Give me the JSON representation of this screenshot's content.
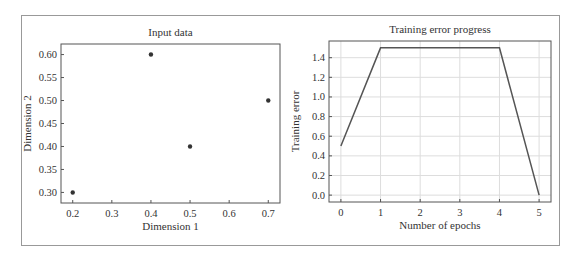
{
  "chart_data": [
    {
      "type": "scatter",
      "title": "Input data",
      "xlabel": "Dimension 1",
      "ylabel": "Dimension 2",
      "x": [
        0.2,
        0.4,
        0.5,
        0.7
      ],
      "y": [
        0.3,
        0.6,
        0.4,
        0.5
      ],
      "xlim": [
        0.17,
        0.73
      ],
      "ylim": [
        0.277,
        0.623
      ],
      "xticks": [
        "0.2",
        "0.3",
        "0.4",
        "0.5",
        "0.6",
        "0.7"
      ],
      "yticks": [
        "0.30",
        "0.35",
        "0.40",
        "0.45",
        "0.50",
        "0.55",
        "0.60"
      ],
      "grid": false,
      "marker_color": "#333333"
    },
    {
      "type": "line",
      "title": "Training error progress",
      "xlabel": "Number of epochs",
      "ylabel": "Training error",
      "x": [
        0,
        1,
        2,
        3,
        4,
        5
      ],
      "y": [
        0.5,
        1.5,
        1.5,
        1.5,
        1.5,
        0.0
      ],
      "xlim": [
        -0.3,
        5.3
      ],
      "ylim": [
        -0.07,
        1.57
      ],
      "xticks": [
        "0",
        "1",
        "2",
        "3",
        "4",
        "5"
      ],
      "yticks": [
        "0.0",
        "0.2",
        "0.4",
        "0.6",
        "0.8",
        "1.0",
        "1.2",
        "1.4"
      ],
      "grid": true,
      "line_color": "#555555"
    }
  ]
}
